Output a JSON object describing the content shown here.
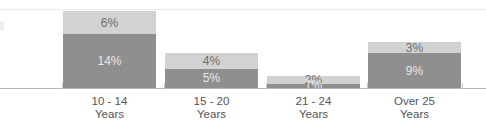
{
  "chart_data": {
    "type": "bar",
    "subtype": "stacked-bar",
    "title": "",
    "subtitle": "",
    "xlabel": "",
    "ylabel": "",
    "grid": false,
    "legend": "none",
    "ylim": [
      0,
      22
    ],
    "categories": [
      "10 - 14\nYears",
      "15 - 20\nYears",
      "21 - 24\nYears",
      "Over 25\nYears"
    ],
    "category_lines": [
      {
        "line1": "10 - 14",
        "line2": "Years"
      },
      {
        "line1": "15 - 20",
        "line2": "Years"
      },
      {
        "line1": "21 - 24",
        "line2": "Years"
      },
      {
        "line1": "Over 25",
        "line2": "Years"
      }
    ],
    "series": [
      {
        "name": "lower-segment",
        "color": "#8f8f8f",
        "values": [
          14,
          5,
          1,
          9
        ],
        "labels": [
          "14%",
          "5%",
          "1%",
          "9%"
        ]
      },
      {
        "name": "upper-segment",
        "color": "#d2d2d2",
        "values": [
          6,
          4,
          2,
          3
        ],
        "labels": [
          "6%",
          "4%",
          "2%",
          "3%"
        ]
      }
    ],
    "totals": [
      20,
      9,
      3,
      12
    ],
    "value_suffix": "%",
    "colors": {
      "upper": "#d2d2d2",
      "lower": "#8f8f8f",
      "axis": "#b4b4b4",
      "top_rule": "#ececec",
      "label_text": "#555555",
      "upper_value_text": "#6e6e6e",
      "lower_value_text": "#e8e8e8",
      "background": "#ffffff"
    },
    "geometry": {
      "baseline_y": 88,
      "px_per_unit": 3.85,
      "bar_width": 93,
      "bar_left_positions": [
        63,
        165,
        267,
        368
      ]
    }
  }
}
